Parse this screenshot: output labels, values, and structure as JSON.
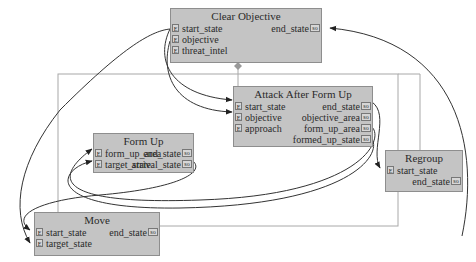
{
  "diagram": {
    "nodes": {
      "clear_objective": {
        "title": "Clear Objective",
        "inputs": [
          "start_state",
          "objective",
          "threat_intel"
        ],
        "outputs": [
          "end_state"
        ]
      },
      "attack_after_form_up": {
        "title": "Attack After Form Up",
        "inputs": [
          "start_state",
          "objective",
          "approach"
        ],
        "outputs": [
          "end_state",
          "objective_area",
          "form_up_area",
          "formed_up_state"
        ]
      },
      "form_up": {
        "title": "Form Up",
        "inputs": [
          "form_up_area",
          "target_state"
        ],
        "outputs": [
          "end_state",
          "arrival_state"
        ]
      },
      "regroup": {
        "title": "Regroup",
        "inputs": [
          "start_state"
        ],
        "outputs": [
          "end_state"
        ]
      },
      "move": {
        "title": "Move",
        "inputs": [
          "start_state",
          "target_state"
        ],
        "outputs": [
          "end_state"
        ]
      }
    },
    "port_glyphs": {
      "input": "E",
      "output": "so"
    },
    "colors": {
      "node_fill": "#c4c4c4",
      "node_border": "#8e8e8e",
      "wire": "#333333",
      "container": "#a8a8a8"
    }
  }
}
